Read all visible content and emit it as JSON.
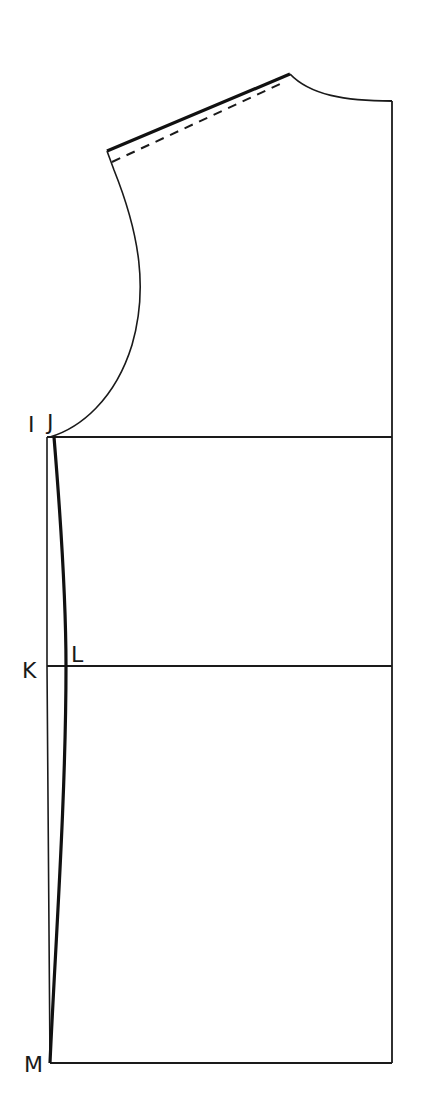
{
  "diagram": {
    "type": "sewing-pattern-bodice-block",
    "background": "#ffffff",
    "line_color": "#1a1a1a",
    "labels": {
      "I": "I",
      "J": "J",
      "K": "K",
      "L": "L",
      "M": "M"
    },
    "points": {
      "shoulder_outer": [
        107,
        151
      ],
      "shoulder_neck": [
        290,
        74
      ],
      "neck_center": [
        392,
        101
      ],
      "armhole_bottom_J": [
        52,
        437
      ],
      "I": [
        47,
        437
      ],
      "K": [
        47,
        666
      ],
      "L": [
        66,
        666
      ],
      "M": [
        50,
        1063
      ],
      "right_bottom": [
        392,
        1063
      ]
    },
    "lines": {
      "chest_line": "I-J horizontal at y=437",
      "waist_line": "K-L horizontal at y=666",
      "hem_line": "bottom edge at y=1063",
      "center_front": "right vertical edge x=392",
      "side_seam": "bold curved line J-L-M",
      "shoulder_seam": "bold line with dashed seam allowance"
    }
  }
}
